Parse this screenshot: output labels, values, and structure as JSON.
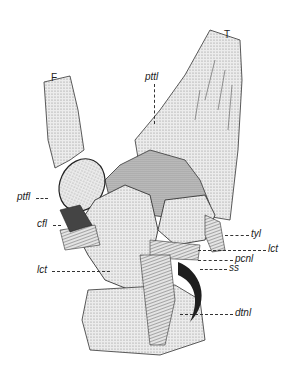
{
  "figure": {
    "type": "anatomical illustration",
    "bones": [
      {
        "id": "F",
        "label": "F"
      },
      {
        "id": "T",
        "label": "T"
      }
    ],
    "labels": [
      {
        "id": "pttl",
        "text": "pttl"
      },
      {
        "id": "ptfl",
        "text": "ptfl"
      },
      {
        "id": "cfl",
        "text": "cfl"
      },
      {
        "id": "tyl",
        "text": "tyl"
      },
      {
        "id": "lct_right",
        "text": "lct"
      },
      {
        "id": "pcnl",
        "text": "pcnl"
      },
      {
        "id": "ss",
        "text": "ss"
      },
      {
        "id": "lct_left",
        "text": "lct"
      },
      {
        "id": "dtnl",
        "text": "dtnl"
      }
    ],
    "colors": {
      "ink": "#222222",
      "shade": "#b5b5b5",
      "light": "#e6e6e6",
      "dark": "#333333"
    }
  }
}
